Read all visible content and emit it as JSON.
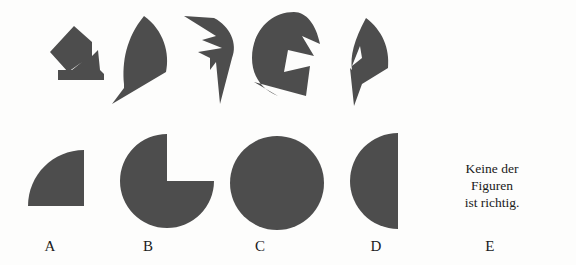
{
  "page": {
    "background_color": "#fdfdfc",
    "shape_fill_color": "#4d4d4d",
    "text_color": "#1a1a1a",
    "width": 576,
    "height": 265,
    "kind": "spatial-reasoning-test-item",
    "language": "de"
  },
  "pieces": {
    "title": "Puzzle pieces",
    "items": [
      {
        "id": "piece-1",
        "name": "rotated-square-with-notch-piece"
      },
      {
        "id": "piece-2",
        "name": "crescent-blade-piece"
      },
      {
        "id": "piece-3",
        "name": "zigzag-arrow-piece"
      },
      {
        "id": "piece-4",
        "name": "notched-ring-piece"
      },
      {
        "id": "piece-5",
        "name": "double-wedge-piece"
      }
    ]
  },
  "options": {
    "title": "Answer options",
    "items": [
      {
        "label": "A",
        "name": "quarter-circle",
        "shape": "quarter-circle"
      },
      {
        "label": "B",
        "name": "circle-with-quarter-removed",
        "shape": "pac-man-quarter"
      },
      {
        "label": "C",
        "name": "full-circle",
        "shape": "circle"
      },
      {
        "label": "D",
        "name": "half-circle",
        "shape": "half-circle"
      },
      {
        "label": "E",
        "name": "none-of-the-figures",
        "shape": "text"
      }
    ]
  },
  "option_e": {
    "line1": "Keine der",
    "line2": "Figuren",
    "line3": "ist richtig."
  }
}
